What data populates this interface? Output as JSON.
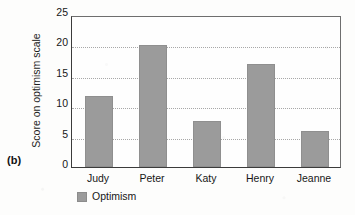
{
  "panel": {
    "label": "(b)"
  },
  "legend": {
    "swatch_name": "legend-color-swatch",
    "entries": [
      "Optimism"
    ]
  },
  "colors": {
    "bar_fill": "#9b9b9b",
    "axis": "#3b3b3b",
    "gridline": "#a8a8a8",
    "background": "#fdfdfc",
    "text": "#171717"
  },
  "chart_data": {
    "type": "bar",
    "title": "",
    "subtitle": "",
    "xlabel": "",
    "ylabel": "Score on optimism scale",
    "categories": [
      "Judy",
      "Peter",
      "Katy",
      "Henry",
      "Jeanne"
    ],
    "series": [
      {
        "name": "Optimism",
        "values": [
          11.7,
          20.1,
          7.6,
          17.0,
          6.0
        ]
      }
    ],
    "values": [
      11.7,
      20.1,
      7.6,
      17.0,
      6.0
    ],
    "ylim": [
      0,
      25
    ],
    "yticks": [
      0,
      5,
      10,
      15,
      20,
      25
    ],
    "ytick_labels": [
      "0",
      "5",
      "10",
      "15",
      "20",
      "25"
    ],
    "grid": "horizontal-dotted",
    "legend_position": "below-axis-left",
    "annotations": [
      "(b)"
    ]
  }
}
